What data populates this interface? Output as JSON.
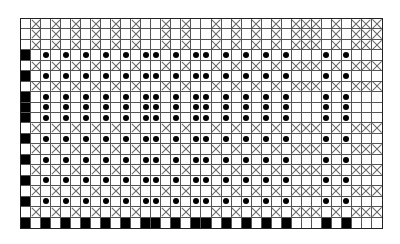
{
  "chart_data": {
    "type": "grid-pattern",
    "title": "",
    "columns": 36,
    "rows": 20,
    "legend": {
      "x": "cross-hatched cell",
      "dot": "cell with filled dot",
      "black": "solid black cell",
      "empty": "blank cell"
    },
    "x_columns": [
      1,
      3,
      5,
      7,
      9,
      11,
      14,
      16,
      19,
      21,
      23,
      25,
      27,
      28,
      29,
      31,
      33,
      34,
      35
    ],
    "dot_columns": [
      2,
      4,
      6,
      8,
      10,
      12,
      13,
      15,
      17,
      18,
      20,
      22,
      24,
      26,
      30,
      32
    ],
    "row_types": [
      "x",
      "x",
      "x",
      "dot",
      "x",
      "dot",
      "x",
      "dot",
      "dot",
      "dot",
      "x",
      "dot",
      "x",
      "dot",
      "x",
      "dot",
      "x",
      "dot",
      "x",
      "base"
    ],
    "row_rules": {
      "x": "first column blank; x_columns cross-hatched; others blank",
      "dot": "first column black; dot_columns dotted; others blank",
      "base": "first column black; dot_columns black; others blank"
    }
  },
  "colors": {
    "fill": "#000000",
    "grid": "#555555",
    "background": "#ffffff"
  }
}
